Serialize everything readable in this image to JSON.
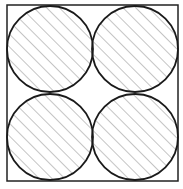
{
  "diagram": {
    "frame": {
      "x": 7,
      "y": 5,
      "width": 171,
      "height": 176,
      "stroke": "#222222"
    },
    "circles": [
      {
        "id": "top-left",
        "cx": 50,
        "cy": 49,
        "r": 43
      },
      {
        "id": "top-right",
        "cx": 135,
        "cy": 49,
        "r": 43
      },
      {
        "id": "bottom-left",
        "cx": 50,
        "cy": 137,
        "r": 43
      },
      {
        "id": "bottom-right",
        "cx": 135,
        "cy": 137,
        "r": 43
      }
    ],
    "hatch": {
      "angle_deg": 45,
      "spacing": 9,
      "color": "#8a8a8a"
    },
    "circle_stroke": "#1a1a1a"
  }
}
